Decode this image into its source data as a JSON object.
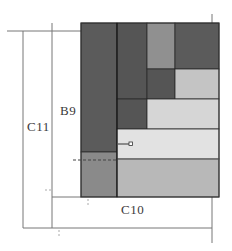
{
  "diagram": {
    "labels": {
      "c11": "C11",
      "b9": "B9",
      "c10": "C10"
    },
    "colors": {
      "dark": "#5b5b5b",
      "darker": "#555555",
      "mid": "#909090",
      "mid2": "#8a8a8a",
      "light": "#c4c4c4",
      "lighter": "#d6d6d6",
      "lightest": "#e2e2e2",
      "band": "#b8b8b8",
      "band_line": "#7a7a7a",
      "line": "#6e6e6e",
      "edge": "#222222"
    },
    "panels": [
      {
        "id": "left-tall",
        "x": 81,
        "y": 23,
        "w": 36,
        "h": 129,
        "tone": "dark"
      },
      {
        "id": "left-bottom",
        "x": 81,
        "y": 152,
        "w": 36,
        "h": 45,
        "tone": "mid2"
      },
      {
        "id": "col2-top",
        "x": 117,
        "y": 23,
        "w": 30,
        "h": 76,
        "tone": "darker"
      },
      {
        "id": "col3-top",
        "x": 147,
        "y": 23,
        "w": 28,
        "h": 46,
        "tone": "mid"
      },
      {
        "id": "col4-top",
        "x": 175,
        "y": 23,
        "w": 44,
        "h": 46,
        "tone": "dark"
      },
      {
        "id": "col3-mid",
        "x": 147,
        "y": 69,
        "w": 28,
        "h": 30,
        "tone": "darker"
      },
      {
        "id": "col4-mid",
        "x": 175,
        "y": 69,
        "w": 44,
        "h": 30,
        "tone": "light"
      },
      {
        "id": "col2-mid2",
        "x": 117,
        "y": 99,
        "w": 30,
        "h": 30,
        "tone": "darker"
      },
      {
        "id": "right-mid2",
        "x": 147,
        "y": 99,
        "w": 72,
        "h": 30,
        "tone": "lighter"
      },
      {
        "id": "lower-band",
        "x": 117,
        "y": 129,
        "w": 102,
        "h": 30,
        "tone": "lightest"
      },
      {
        "id": "bottom-band",
        "x": 117,
        "y": 159,
        "w": 102,
        "h": 38,
        "tone": "band"
      }
    ]
  }
}
